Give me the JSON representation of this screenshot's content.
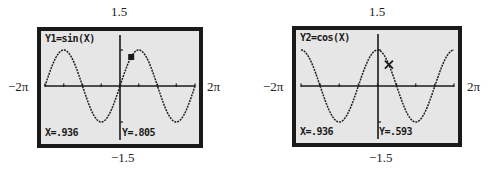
{
  "chart_data": [
    {
      "type": "line",
      "title": "Y1=sin(X)",
      "function": "sin(X)",
      "xlim": [
        "-2π",
        "2π"
      ],
      "ylim": [
        -1.5,
        1.5
      ],
      "x_tick_labels": {
        "min": "−2π",
        "max": "2π"
      },
      "y_tick_labels": {
        "max": "1.5",
        "min": "−1.5"
      },
      "trace": {
        "x": 0.936,
        "y": 0.805,
        "x_label": "X=.936",
        "y_label": "Y=.805"
      },
      "grid": false
    },
    {
      "type": "line",
      "title": "Y2=cos(X)",
      "function": "cos(X)",
      "xlim": [
        "-2π",
        "2π"
      ],
      "ylim": [
        -1.5,
        1.5
      ],
      "x_tick_labels": {
        "min": "−2π",
        "max": "2π"
      },
      "y_tick_labels": {
        "max": "1.5",
        "min": "−1.5"
      },
      "trace": {
        "x": 0.936,
        "y": 0.593,
        "x_label": "X=.936",
        "y_label": "Y=.593"
      },
      "grid": false
    }
  ],
  "left": {
    "equation": "Y1=sin(X)",
    "x_readout": "X=.936",
    "y_readout": "Y=.805",
    "ymax": "1.5",
    "ymin": "−1.5",
    "xmin": "−2π",
    "xmax": "2π"
  },
  "right": {
    "equation": "Y2=cos(X)",
    "x_readout": "X=.936",
    "y_readout": "Y=.593",
    "ymax": "1.5",
    "ymin": "−1.5",
    "xmin": "−2π",
    "xmax": "2π"
  }
}
